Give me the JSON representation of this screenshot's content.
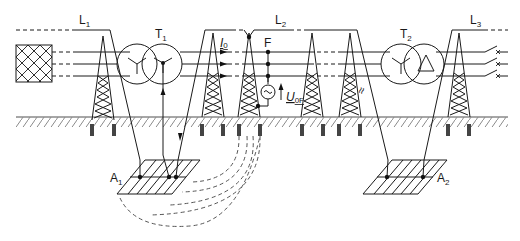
{
  "figure": {
    "labels": {
      "line1": "L",
      "line1_sub": "1",
      "line2": "L",
      "line2_sub": "2",
      "line3": "L",
      "line3_sub": "3",
      "transformer1": "T",
      "transformer1_sub": "1",
      "transformer2": "T",
      "transformer2_sub": "2",
      "current": "I",
      "current_sub": "0",
      "fault": "F",
      "voltage": "U",
      "voltage_sub": "0F",
      "grid1": "A",
      "grid1_sub": "1",
      "grid2": "A",
      "grid2_sub": "2"
    },
    "components": {
      "source": "crosshatched-source-block",
      "T1_windings": [
        "star",
        "star-grounded"
      ],
      "T2_windings": [
        "star",
        "delta"
      ],
      "towers_count": 6,
      "phases_count": 3,
      "breakers_count": 3
    },
    "colors": {
      "line": "#1a1a1a",
      "ground_hatch": "#8a8a8a",
      "foundation": "#444444"
    }
  }
}
